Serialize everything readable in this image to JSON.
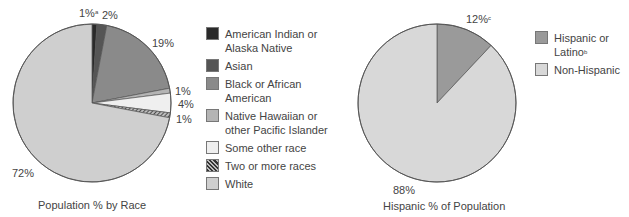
{
  "chart_data": [
    {
      "type": "pie",
      "title": "Population % by Race",
      "categories": [
        "American Indian or Alaska Native",
        "Asian",
        "Black or African American",
        "Native Hawaiian or other Pacific Islander",
        "Some other race",
        "Two or more races",
        "White"
      ],
      "values": [
        1,
        2,
        19,
        1,
        4,
        1,
        72
      ],
      "labels": [
        "1%",
        "2%",
        "19%",
        "1%",
        "4%",
        "1%",
        "72%"
      ],
      "annotations": [
        {
          "label": "1%",
          "footnote": "a"
        }
      ],
      "colors": [
        "#2a2a2a",
        "#555555",
        "#8a8a8a",
        "#b4b4b4",
        "#efefef",
        "hatched",
        "#cfcfcf"
      ],
      "legend_position": "right"
    },
    {
      "type": "pie",
      "title": "Hispanic % of Population",
      "categories": [
        "Hispanic or Latino",
        "Non-Hispanic"
      ],
      "values": [
        12,
        88
      ],
      "labels": [
        "12%",
        "88%"
      ],
      "annotations": [
        {
          "label": "12%",
          "footnote": "c"
        },
        {
          "legend": "Hispanic or Latino",
          "footnote": "b"
        }
      ],
      "colors": [
        "#9a9a9a",
        "#d8d8d8"
      ],
      "legend_position": "right"
    }
  ],
  "race_chart": {
    "title": "Population % by Race",
    "labels": {
      "amind": "1%",
      "amind_note": "a",
      "asian": "2%",
      "black": "19%",
      "nhpi": "1%",
      "other": "4%",
      "two": "1%",
      "white": "72%"
    },
    "legend": [
      {
        "label": "American Indian or Alaska Native",
        "color": "#2a2a2a"
      },
      {
        "label": "Asian",
        "color": "#555555"
      },
      {
        "label": "Black or African American",
        "color": "#8a8a8a"
      },
      {
        "label": "Native Hawaiian or other Pacific Islander",
        "color": "#b4b4b4"
      },
      {
        "label": "Some other race",
        "color": "#efefef"
      },
      {
        "label": "Two or more races",
        "color": "hatched"
      },
      {
        "label": "White",
        "color": "#cfcfcf"
      }
    ]
  },
  "hispanic_chart": {
    "title": "Hispanic % of Population",
    "labels": {
      "hispanic": "12%",
      "hispanic_note": "c",
      "non": "88%"
    },
    "legend": [
      {
        "label": "Hispanic or Latino",
        "note": "b",
        "color": "#9a9a9a"
      },
      {
        "label": "Non-Hispanic",
        "color": "#d8d8d8"
      }
    ]
  }
}
